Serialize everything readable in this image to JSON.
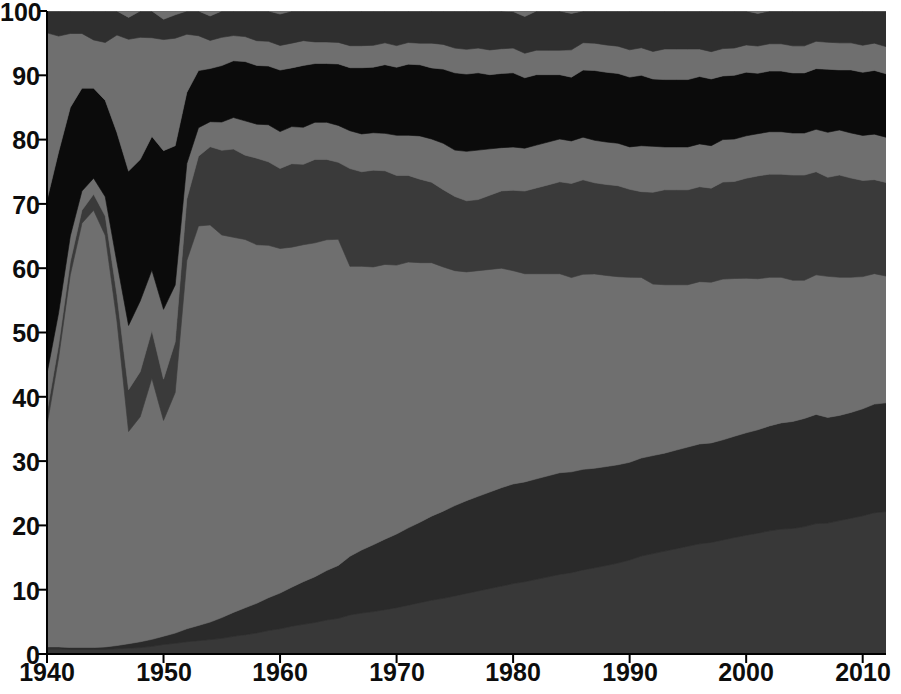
{
  "chart_data": {
    "type": "area",
    "stacked": true,
    "normalized": true,
    "title": "",
    "subtitle": "",
    "xlabel": "",
    "ylabel": "",
    "xlim": [
      1940,
      2012
    ],
    "ylim": [
      0,
      100
    ],
    "grid": false,
    "legend_position": "none",
    "xticks": [
      1940,
      1950,
      1960,
      1970,
      1980,
      1990,
      2000,
      2010
    ],
    "xtick_labels": [
      "1940",
      "1950",
      "1960",
      "1970",
      "1980",
      "1990",
      "2000",
      "2010"
    ],
    "yticks": [
      0,
      10,
      20,
      30,
      40,
      50,
      60,
      70,
      80,
      90,
      100
    ],
    "ytick_labels": [
      "0",
      "10",
      "20",
      "30",
      "40",
      "50",
      "60",
      "70",
      "80",
      "90",
      "100"
    ],
    "x": [
      1940,
      1941,
      1942,
      1943,
      1944,
      1945,
      1946,
      1947,
      1948,
      1949,
      1950,
      1951,
      1952,
      1953,
      1954,
      1955,
      1956,
      1957,
      1958,
      1959,
      1960,
      1961,
      1962,
      1963,
      1964,
      1965,
      1966,
      1967,
      1968,
      1969,
      1970,
      1971,
      1972,
      1973,
      1974,
      1975,
      1976,
      1977,
      1978,
      1979,
      1980,
      1981,
      1982,
      1983,
      1984,
      1985,
      1986,
      1987,
      1988,
      1989,
      1990,
      1991,
      1992,
      1993,
      1994,
      1995,
      1996,
      1997,
      1998,
      1999,
      2000,
      2001,
      2002,
      2003,
      2004,
      2005,
      2006,
      2007,
      2008,
      2009,
      2010,
      2011,
      2012
    ],
    "series": [
      {
        "name": "series-1",
        "color": "#383838",
        "values": [
          0.8,
          0.8,
          0.7,
          0.7,
          0.7,
          0.7,
          0.8,
          0.9,
          1.0,
          1.2,
          1.5,
          1.7,
          1.9,
          2.1,
          2.3,
          2.5,
          2.8,
          3.1,
          3.4,
          3.8,
          4.1,
          4.5,
          4.8,
          5.1,
          5.5,
          5.8,
          6.2,
          6.5,
          6.8,
          7.1,
          7.5,
          7.9,
          8.3,
          8.7,
          9.0,
          9.4,
          9.8,
          10.2,
          10.6,
          11.0,
          11.4,
          11.8,
          12.2,
          12.6,
          13.0,
          13.4,
          13.8,
          14.2,
          14.6,
          15.0,
          15.5,
          16.0,
          16.4,
          16.8,
          17.2,
          17.6,
          18.0,
          18.4,
          18.8,
          19.2,
          19.6,
          20.0,
          20.3,
          20.6,
          20.9,
          21.2,
          21.5,
          21.8,
          22.2,
          22.6,
          23.0,
          23.3,
          23.6
        ]
      },
      {
        "name": "series-2",
        "color": "#2a2a2a",
        "values": [
          0.3,
          0.3,
          0.3,
          0.3,
          0.3,
          0.4,
          0.5,
          0.7,
          0.9,
          1.1,
          1.3,
          1.6,
          2.0,
          2.4,
          2.8,
          3.3,
          3.8,
          4.3,
          4.8,
          5.3,
          5.8,
          6.3,
          6.9,
          7.4,
          8.0,
          8.6,
          9.3,
          10.0,
          10.7,
          11.3,
          11.9,
          12.5,
          13.0,
          13.6,
          14.1,
          14.6,
          15.0,
          15.3,
          15.6,
          15.9,
          16.1,
          16.3,
          16.4,
          16.5,
          16.6,
          16.6,
          16.5,
          16.4,
          16.3,
          16.2,
          16.1,
          16.0,
          16.0,
          16.0,
          16.1,
          16.2,
          16.3,
          16.4,
          16.5,
          16.7,
          16.9,
          17.1,
          17.3,
          17.5,
          17.8,
          18.0,
          18.0,
          17.6,
          17.5,
          17.6,
          17.8,
          17.9,
          18.0
        ]
      },
      {
        "name": "series-3",
        "color": "#6f6f6f",
        "values": [
          34.5,
          45.0,
          58.0,
          66.0,
          68.0,
          64.0,
          50.0,
          33.0,
          35.0,
          41.0,
          34.0,
          38.0,
          57.0,
          63.0,
          63.5,
          61.0,
          59.5,
          59.0,
          58.0,
          57.0,
          56.0,
          55.0,
          54.5,
          54.0,
          53.5,
          53.0,
          46.0,
          45.0,
          44.5,
          44.0,
          43.5,
          43.0,
          42.0,
          41.0,
          39.5,
          38.0,
          37.0,
          36.5,
          36.0,
          35.5,
          34.5,
          34.0,
          33.5,
          33.0,
          32.5,
          32.0,
          32.0,
          32.0,
          31.5,
          31.0,
          30.5,
          29.5,
          28.0,
          27.5,
          27.0,
          26.5,
          26.5,
          26.5,
          26.5,
          26.0,
          25.5,
          25.0,
          24.5,
          24.0,
          23.5,
          23.0,
          23.0,
          23.5,
          23.0,
          22.5,
          22.0,
          21.5,
          21.0
        ]
      },
      {
        "name": "series-4",
        "color": "#3a3a3a",
        "values": [
          2.0,
          2.0,
          2.0,
          2.0,
          2.5,
          3.0,
          4.0,
          6.5,
          7.0,
          7.5,
          6.5,
          8.0,
          9.5,
          11.0,
          12.5,
          13.5,
          14.0,
          13.5,
          14.0,
          13.5,
          13.0,
          13.5,
          13.0,
          13.5,
          13.0,
          12.5,
          15.5,
          15.0,
          15.5,
          15.0,
          14.5,
          14.0,
          13.5,
          13.0,
          12.5,
          12.0,
          11.5,
          11.5,
          12.0,
          12.5,
          13.0,
          13.5,
          14.0,
          14.5,
          15.0,
          15.5,
          15.5,
          15.0,
          15.0,
          15.0,
          14.5,
          14.0,
          15.0,
          15.5,
          15.5,
          15.5,
          15.5,
          15.5,
          16.0,
          16.0,
          16.5,
          17.0,
          17.0,
          17.0,
          17.5,
          17.5,
          17.0,
          16.5,
          17.0,
          16.5,
          16.0,
          15.5,
          15.5
        ]
      },
      {
        "name": "series-5",
        "color": "#6f6f6f",
        "values": [
          6.0,
          5.0,
          4.0,
          3.0,
          2.5,
          3.0,
          5.0,
          10.0,
          11.0,
          9.5,
          11.0,
          9.0,
          5.5,
          4.5,
          4.0,
          4.5,
          5.0,
          5.5,
          5.5,
          6.0,
          6.0,
          6.0,
          6.0,
          6.0,
          6.0,
          6.0,
          6.0,
          6.0,
          6.0,
          6.0,
          6.5,
          6.5,
          7.0,
          7.0,
          7.5,
          7.5,
          8.0,
          8.0,
          7.5,
          7.0,
          7.0,
          7.0,
          7.0,
          7.0,
          7.0,
          7.0,
          7.0,
          7.0,
          7.0,
          7.0,
          7.0,
          7.5,
          7.5,
          7.0,
          7.0,
          7.0,
          7.0,
          7.0,
          7.0,
          7.0,
          7.0,
          7.0,
          7.0,
          7.0,
          7.0,
          7.0,
          7.0,
          7.5,
          7.5,
          7.5,
          7.5,
          7.5,
          7.5
        ]
      },
      {
        "name": "series-6",
        "color": "#0b0b0b",
        "values": [
          27.0,
          25.0,
          20.0,
          16.0,
          14.0,
          15.0,
          20.0,
          24.0,
          22.0,
          21.0,
          25.0,
          22.0,
          11.0,
          9.0,
          8.5,
          9.0,
          9.0,
          9.5,
          9.5,
          9.5,
          10.0,
          9.5,
          10.0,
          9.5,
          9.5,
          10.0,
          10.0,
          10.5,
          10.5,
          11.0,
          11.0,
          11.5,
          11.5,
          11.5,
          12.0,
          12.5,
          12.5,
          12.5,
          12.0,
          12.0,
          12.0,
          11.5,
          11.5,
          11.0,
          10.5,
          10.5,
          11.0,
          11.5,
          11.5,
          11.5,
          11.5,
          11.5,
          11.0,
          11.0,
          11.0,
          11.0,
          11.0,
          11.0,
          10.5,
          10.5,
          10.5,
          10.0,
          10.0,
          10.0,
          10.0,
          10.0,
          10.0,
          10.5,
          10.0,
          10.5,
          10.5,
          10.5,
          10.5
        ]
      },
      {
        "name": "series-7",
        "color": "#6f6f6f",
        "values": [
          26.0,
          18.0,
          11.5,
          8.5,
          7.5,
          9.0,
          15.0,
          20.5,
          19.0,
          15.5,
          17.5,
          17.0,
          9.0,
          5.5,
          4.5,
          4.5,
          4.0,
          4.0,
          4.0,
          4.0,
          4.0,
          4.0,
          4.0,
          3.5,
          3.5,
          3.5,
          3.5,
          3.5,
          3.5,
          3.5,
          3.5,
          3.5,
          3.5,
          4.0,
          4.0,
          4.0,
          4.0,
          4.0,
          4.0,
          4.0,
          4.0,
          4.0,
          4.0,
          4.0,
          4.0,
          4.5,
          4.5,
          4.5,
          4.5,
          4.5,
          4.5,
          4.5,
          4.5,
          5.0,
          5.0,
          5.0,
          4.5,
          4.5,
          4.5,
          4.5,
          4.5,
          4.5,
          4.5,
          4.5,
          4.5,
          4.5,
          4.5,
          4.5,
          4.5,
          4.5,
          4.5,
          4.5,
          4.5
        ]
      },
      {
        "name": "series-8-top",
        "color": "#2f2f2f",
        "values": [
          3.4,
          3.9,
          3.5,
          3.5,
          4.5,
          4.9,
          3.7,
          3.4,
          4.1,
          4.2,
          3.2,
          3.7,
          3.6,
          3.9,
          3.9,
          4.2,
          3.9,
          4.1,
          4.8,
          4.9,
          5.1,
          5.2,
          4.8,
          5.0,
          5.0,
          5.1,
          5.5,
          5.5,
          5.5,
          5.1,
          5.6,
          5.1,
          5.2,
          5.2,
          5.4,
          6.0,
          6.2,
          6.0,
          6.3,
          6.1,
          5.9,
          6.0,
          6.4,
          6.4,
          6.4,
          6.0,
          5.2,
          5.3,
          5.6,
          5.8,
          6.4,
          6.0,
          6.6,
          6.2,
          6.2,
          6.2,
          6.2,
          6.7,
          6.2,
          6.1,
          5.6,
          5.4,
          5.4,
          5.4,
          5.8,
          5.8,
          5.0,
          5.2,
          5.3,
          5.3,
          5.7,
          5.3,
          5.9
        ]
      },
      {
        "name": "series-9-cap",
        "color": "#6f6f6f",
        "values": [
          0.0,
          0.0,
          0.0,
          0.0,
          0.0,
          0.0,
          0.0,
          1.0,
          0.0,
          0.0,
          1.3,
          0.6,
          0.0,
          0.0,
          0.8,
          0.0,
          0.0,
          0.0,
          0.0,
          0.0,
          0.5,
          0.0,
          0.0,
          0.0,
          0.0,
          0.0,
          0.0,
          0.0,
          0.0,
          0.0,
          0.0,
          0.0,
          0.0,
          0.0,
          0.0,
          0.0,
          0.0,
          0.0,
          0.0,
          0.0,
          0.1,
          0.9,
          0.0,
          0.0,
          0.0,
          0.4,
          0.0,
          0.0,
          0.0,
          0.0,
          0.0,
          0.0,
          0.0,
          0.0,
          0.0,
          0.0,
          0.0,
          0.0,
          0.0,
          0.0,
          0.0,
          0.4,
          0.0,
          0.0,
          0.0,
          0.0,
          0.0,
          0.0,
          0.0,
          0.0,
          0.0,
          0.0,
          0.0
        ]
      }
    ],
    "colors": {
      "background": "#ffffff",
      "plot_background": "#6f6f6f",
      "axis": "#000000",
      "tick_label": "#0d0d0d"
    }
  },
  "axes": {
    "y_labels": [
      "100",
      "90",
      "80",
      "70",
      "60",
      "50",
      "40",
      "30",
      "20",
      "10",
      "0"
    ],
    "x_labels": [
      "1940",
      "1950",
      "1960",
      "1970",
      "1980",
      "1990",
      "2000",
      "2010"
    ]
  }
}
